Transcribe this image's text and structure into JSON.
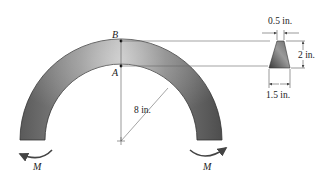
{
  "labels": {
    "point_b": "B",
    "point_a": "A",
    "radius": "8 in.",
    "moment_left": "M",
    "moment_right": "M",
    "top_width": "0.5 in.",
    "height": "2 in.",
    "bottom_width": "1.5 in."
  },
  "colors": {
    "arch_dark": "#4a4a4a",
    "arch_light": "#c8c8c8",
    "line": "#555555",
    "text": "#222222"
  }
}
